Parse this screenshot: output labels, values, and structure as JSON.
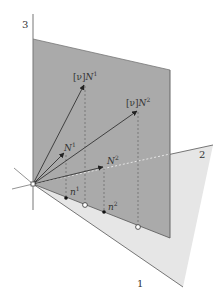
{
  "diagram": {
    "axes": {
      "axis3_label": "3",
      "axis2_label": "2",
      "axis1_label": "1"
    },
    "vectors": {
      "nuN1": {
        "prefix": "[ν]",
        "base": "N",
        "sup": "1"
      },
      "N1": {
        "base": "N",
        "sup": "1"
      },
      "nuN2": {
        "prefix": "[ν]",
        "base": "N",
        "sup": "2"
      },
      "N2": {
        "base": "N",
        "sup": "2"
      }
    },
    "points": {
      "n1": {
        "base": "n",
        "sup": "1"
      },
      "n2": {
        "base": "n",
        "sup": "2"
      }
    },
    "colors": {
      "vertical_plane": "#a9a9a9",
      "horizontal_plane": "#e4e4e4",
      "lines": "#444444",
      "dashed": "#666666"
    }
  }
}
